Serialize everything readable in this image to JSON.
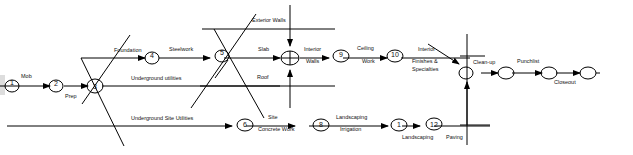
{
  "diagram": {
    "type": "activity-network",
    "nodes": [
      {
        "id": "1",
        "label": "1"
      },
      {
        "id": "2",
        "label": "2"
      },
      {
        "id": "3",
        "label": "3"
      },
      {
        "id": "4",
        "label": "4"
      },
      {
        "id": "5",
        "label": "5"
      },
      {
        "id": "7",
        "label": ""
      },
      {
        "id": "9",
        "label": "9"
      },
      {
        "id": "10",
        "label": "10"
      },
      {
        "id": "6",
        "label": "6"
      },
      {
        "id": "8",
        "label": "8"
      },
      {
        "id": "11",
        "label": "1"
      },
      {
        "id": "12",
        "label": "12"
      },
      {
        "id": "13",
        "label": ""
      },
      {
        "id": "14",
        "label": ""
      },
      {
        "id": "15",
        "label": ""
      },
      {
        "id": "16",
        "label": ""
      }
    ],
    "activities": {
      "mob": "Mob",
      "prep": "Prep",
      "foundation": "Foundation",
      "steelwork": "Steelwork",
      "underground_utilities": "Underground utilities",
      "underground_site_utilities": "Underground Site Utilities",
      "exterior_walls": "Exterior Walls",
      "slab": "Slab",
      "roof": "Roof",
      "interior": "Interior",
      "walls": "Walls",
      "ceiling": "Ceiling",
      "work": "Work",
      "interior2": "Interior",
      "finishes": "Finishes &",
      "specialties": "Specialties",
      "site": "Site",
      "concrete_work": "Concrete Work",
      "landscaping_top": "Landscaping",
      "irrigation": "Irrigation",
      "landscaping_bottom": "Landscaping",
      "paving": "Paving",
      "clean_up": "Clean-up",
      "punchlist": "Punchlist",
      "closeout": "Closeout"
    }
  }
}
